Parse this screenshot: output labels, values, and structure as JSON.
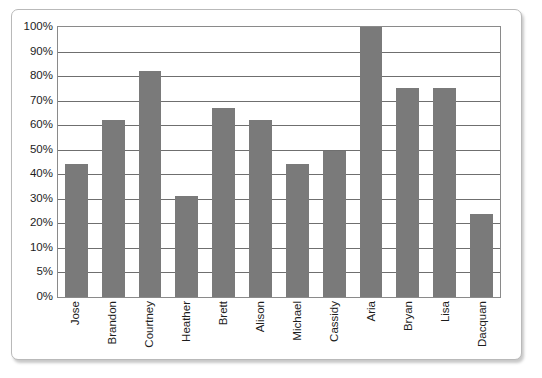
{
  "chart_data": {
    "type": "bar",
    "title": "",
    "subtitle": "",
    "xlabel": "",
    "ylabel": "",
    "categories": [
      "Jose",
      "Brandon",
      "Courtney",
      "Heather",
      "Brett",
      "Alison",
      "Michael",
      "Cassidy",
      "Aria",
      "Bryan",
      "Lisa",
      "Dacquan"
    ],
    "values": [
      44,
      62,
      82,
      31,
      67,
      62,
      44,
      49.5,
      100,
      75,
      75,
      24
    ],
    "series": [
      {
        "name": "Score",
        "values": [
          44,
          62,
          82,
          31,
          67,
          62,
          44,
          49.5,
          100,
          75,
          75,
          24
        ]
      }
    ],
    "value_unit": "%",
    "ytick_labels": [
      "100%",
      "90%",
      "80%",
      "70%",
      "60%",
      "50%",
      "40%",
      "30%",
      "20%",
      "10%",
      "5%",
      "0%"
    ],
    "ytick_values": [
      100,
      90,
      80,
      70,
      60,
      50,
      40,
      30,
      20,
      10,
      5,
      0
    ],
    "ytick_spacing": "even",
    "ylim": [
      0,
      100
    ],
    "grid": "horizontal",
    "legend": "none",
    "bar_color": "#7a7a7a",
    "gridline_color": "#6f6f6f",
    "axis_color": "#8a8a8a",
    "text_color": "#1d1d1d",
    "background_color": "#ffffff",
    "xlabel_rotation": "90"
  }
}
